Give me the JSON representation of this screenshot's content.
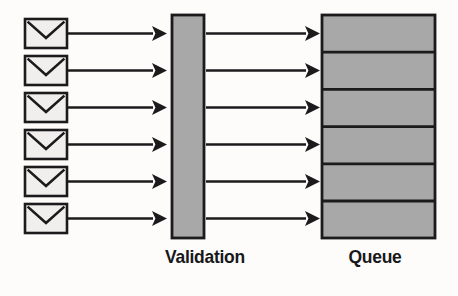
{
  "diagram": {
    "background_color": "#fdfcfa",
    "stroke_color": "#1b1b1d",
    "fill_grey": "#a8a8a8",
    "fill_light": "#f0efed",
    "sources": {
      "count": 6,
      "icon": "envelope-icon",
      "label": "Incoming message",
      "items": [
        {
          "index": 1,
          "name": "message-1"
        },
        {
          "index": 2,
          "name": "message-2"
        },
        {
          "index": 3,
          "name": "message-3"
        },
        {
          "index": 4,
          "name": "message-4"
        },
        {
          "index": 5,
          "name": "message-5"
        },
        {
          "index": 6,
          "name": "message-6"
        }
      ]
    },
    "validation": {
      "label": "Validation",
      "fill": "#a8a8a8"
    },
    "queue": {
      "label": "Queue",
      "fill": "#a8a8a8",
      "slots": 6,
      "slot_labels": [
        "",
        "",
        "",
        "",
        "",
        ""
      ]
    },
    "arrows": {
      "input_count": 6,
      "output_count": 6,
      "direction": "left-to-right"
    }
  }
}
